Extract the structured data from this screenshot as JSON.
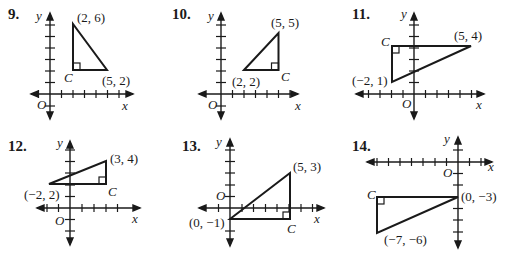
{
  "problems": [
    {
      "number": "9.",
      "axis_labels": {
        "x": "x",
        "y": "y",
        "origin": "O"
      },
      "vertices": [
        {
          "label": "(2, 6)",
          "x": 2,
          "y": 6
        },
        {
          "label": "(5, 2)",
          "x": 5,
          "y": 2
        },
        {
          "label": "C",
          "x": 2,
          "y": 2,
          "right_angle": true
        }
      ]
    },
    {
      "number": "10.",
      "axis_labels": {
        "x": "x",
        "y": "y",
        "origin": "O"
      },
      "vertices": [
        {
          "label": "(5, 5)",
          "x": 5,
          "y": 5
        },
        {
          "label": "(2, 2)",
          "x": 2,
          "y": 2
        },
        {
          "label": "C",
          "x": 5,
          "y": 2,
          "right_angle": true
        }
      ]
    },
    {
      "number": "11.",
      "axis_labels": {
        "x": "x",
        "y": "y",
        "origin": "O"
      },
      "vertices": [
        {
          "label": "(5, 4)",
          "x": 5,
          "y": 4
        },
        {
          "label": "(−2, 1)",
          "x": -2,
          "y": 1
        },
        {
          "label": "C",
          "x": -2,
          "y": 4,
          "right_angle": true
        }
      ]
    },
    {
      "number": "12.",
      "axis_labels": {
        "x": "x",
        "y": "y",
        "origin": "O"
      },
      "vertices": [
        {
          "label": "(3, 4)",
          "x": 3,
          "y": 4
        },
        {
          "label": "(−2, 2)",
          "x": -2,
          "y": 2
        },
        {
          "label": "C",
          "x": 3,
          "y": 2,
          "right_angle": true
        }
      ]
    },
    {
      "number": "13.",
      "axis_labels": {
        "x": "x",
        "y": "y",
        "origin": "O"
      },
      "vertices": [
        {
          "label": "(5, 3)",
          "x": 5,
          "y": 3
        },
        {
          "label": "(0, −1)",
          "x": 0,
          "y": -1
        },
        {
          "label": "C",
          "x": 5,
          "y": -1,
          "right_angle": true
        }
      ]
    },
    {
      "number": "14.",
      "axis_labels": {
        "x": "x",
        "y": "y",
        "origin": "O"
      },
      "vertices": [
        {
          "label": "(0, −3)",
          "x": 0,
          "y": -3
        },
        {
          "label": "(−7, −6)",
          "x": -7,
          "y": -6
        },
        {
          "label": "C",
          "x": -7,
          "y": -3,
          "right_angle": true
        }
      ]
    }
  ]
}
